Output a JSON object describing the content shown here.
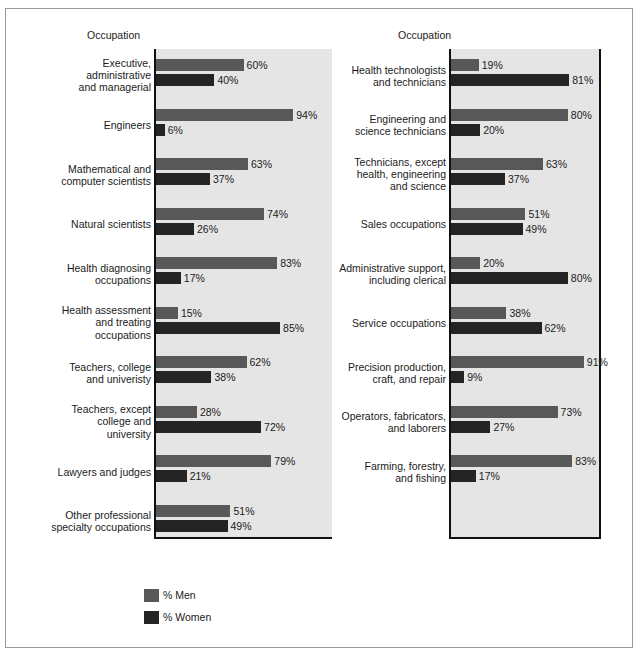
{
  "figure": {
    "panels": [
      {
        "header": "Occupation",
        "rows": [
          {
            "label": "Executive,\nadministrative\nand managerial",
            "men": 60,
            "women": 40,
            "men_text": "60%",
            "women_text": "40%"
          },
          {
            "label": "Engineers",
            "men": 94,
            "women": 6,
            "men_text": "94%",
            "women_text": "6%"
          },
          {
            "label": "Mathematical and\ncomputer scientists",
            "men": 63,
            "women": 37,
            "men_text": "63%",
            "women_text": "37%"
          },
          {
            "label": "Natural scientists",
            "men": 74,
            "women": 26,
            "men_text": "74%",
            "women_text": "26%"
          },
          {
            "label": "Health diagnosing\noccupations",
            "men": 83,
            "women": 17,
            "men_text": "83%",
            "women_text": "17%"
          },
          {
            "label": "Health assessment\nand treating\noccupations",
            "men": 15,
            "women": 85,
            "men_text": "15%",
            "women_text": "85%"
          },
          {
            "label": "Teachers, college\nand univeristy",
            "men": 62,
            "women": 38,
            "men_text": "62%",
            "women_text": "38%"
          },
          {
            "label": "Teachers, except\ncollege and\nuniversity",
            "men": 28,
            "women": 72,
            "men_text": "28%",
            "women_text": "72%"
          },
          {
            "label": "Lawyers and judges",
            "men": 79,
            "women": 21,
            "men_text": "79%",
            "women_text": "21%"
          },
          {
            "label": "Other professional\nspecialty occupations",
            "men": 51,
            "women": 49,
            "men_text": "51%",
            "women_text": "49%"
          }
        ]
      },
      {
        "header": "Occupation",
        "rows": [
          {
            "label": "Health technologists\nand technicians",
            "men": 19,
            "women": 81,
            "men_text": "19%",
            "women_text": "81%"
          },
          {
            "label": "Engineering and\nscience technicians",
            "men": 80,
            "women": 20,
            "men_text": "80%",
            "women_text": "20%"
          },
          {
            "label": "Technicians, except\nhealth, engineering\nand science",
            "men": 63,
            "women": 37,
            "men_text": "63%",
            "women_text": "37%"
          },
          {
            "label": "Sales occupations",
            "men": 51,
            "women": 49,
            "men_text": "51%",
            "women_text": "49%"
          },
          {
            "label": "Administrative support,\nincluding clerical",
            "men": 20,
            "women": 80,
            "men_text": "20%",
            "women_text": "80%"
          },
          {
            "label": "Service occupations",
            "men": 38,
            "women": 62,
            "men_text": "38%",
            "women_text": "62%"
          },
          {
            "label": "Precision production,\ncraft, and repair",
            "men": 91,
            "women": 9,
            "men_text": "91%",
            "women_text": "9%"
          },
          {
            "label": "Operators, fabricators,\nand laborers",
            "men": 73,
            "women": 27,
            "men_text": "73%",
            "women_text": "27%"
          },
          {
            "label": "Farming, forestry,\nand fishing",
            "men": 83,
            "women": 17,
            "men_text": "83%",
            "women_text": "17%"
          }
        ]
      }
    ],
    "legend": [
      {
        "key": "men",
        "label": "% Men",
        "color": "#585858"
      },
      {
        "key": "women",
        "label": "% Women",
        "color": "#242424"
      }
    ]
  },
  "chart_data": {
    "type": "bar",
    "title": "",
    "xlabel": "",
    "ylabel": "Occupation",
    "xlim": [
      0,
      100
    ],
    "grid": false,
    "legend_position": "bottom-left",
    "orientation": "horizontal",
    "value_unit": "%",
    "series": [
      {
        "name": "% Men",
        "color": "#585858"
      },
      {
        "name": "% Women",
        "color": "#242424"
      }
    ],
    "categories": [
      "Executive, administrative and managerial",
      "Engineers",
      "Mathematical and computer scientists",
      "Natural scientists",
      "Health diagnosing occupations",
      "Health assessment and treating occupations",
      "Teachers, college and univeristy",
      "Teachers, except college and university",
      "Lawyers and judges",
      "Other professional specialty occupations",
      "Health technologists and technicians",
      "Engineering and science technicians",
      "Technicians, except health, engineering and science",
      "Sales occupations",
      "Administrative support, including clerical",
      "Service occupations",
      "Precision production, craft, and repair",
      "Operators, fabricators, and laborers",
      "Farming, forestry, and fishing"
    ],
    "values": {
      "% Men": [
        60,
        94,
        63,
        74,
        83,
        15,
        62,
        28,
        79,
        51,
        19,
        80,
        63,
        51,
        20,
        38,
        91,
        73,
        83
      ],
      "% Women": [
        40,
        6,
        37,
        26,
        17,
        85,
        38,
        72,
        21,
        49,
        81,
        20,
        37,
        49,
        80,
        62,
        9,
        27,
        17
      ]
    }
  }
}
